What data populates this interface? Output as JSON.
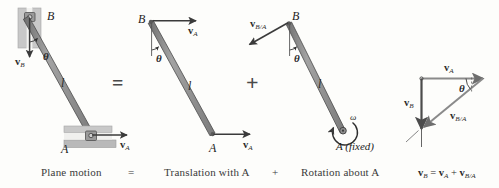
{
  "figure": {
    "title_caption_row": {
      "plane_motion": "Plane motion",
      "equals": "=",
      "translation": "Translation with A",
      "plus": "+",
      "rotation": "Rotation about A",
      "equation_vb": "v",
      "equation_sub_b": "B",
      "equation_eq": " = ",
      "equation_va": "v",
      "equation_sub_a": "A",
      "equation_plus": " + ",
      "equation_vba": "v",
      "equation_sub_ba": "B/A"
    },
    "operators": {
      "equals_sign": "=",
      "plus_sign": "+"
    },
    "panel1": {
      "name": "plane-motion-panel",
      "point_b": "B",
      "point_a": "A",
      "length_label": "l",
      "theta": "θ",
      "vb_label": "v",
      "vb_sub": "B",
      "va_label": "v",
      "va_sub": "A"
    },
    "panel2": {
      "name": "translation-panel",
      "point_b": "B",
      "point_a": "A",
      "length_label": "l",
      "theta": "θ",
      "va_top_label": "v",
      "va_top_sub": "A",
      "va_bottom_label": "v",
      "va_bottom_sub": "A"
    },
    "panel3": {
      "name": "rotation-panel",
      "point_b": "B",
      "point_a": "A (fixed)",
      "length_label": "l",
      "theta": "θ",
      "omega": "ω",
      "vba_label": "v",
      "vba_sub": "B/A"
    },
    "panel4": {
      "name": "velocity-triangle-panel",
      "va_label": "v",
      "va_sub": "A",
      "vb_label": "v",
      "vb_sub": "B",
      "vba_label": "v",
      "vba_sub": "B/A",
      "theta": "θ"
    },
    "colors": {
      "bar_fill": "#8f8f8f",
      "bar_edge": "#4a4a4a",
      "arrow": "#6e6e6e",
      "arrow_dark": "#4c4c4c",
      "guide_fill": "#c9c9c9",
      "guide_edge": "#9a9a9a",
      "text": "#2a2a2a",
      "background": "#fdfdfb"
    }
  }
}
